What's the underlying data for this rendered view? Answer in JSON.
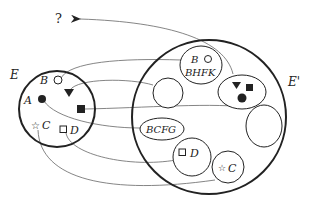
{
  "diagram": {
    "question_mark": "?",
    "source_set": {
      "label": "E",
      "elements": [
        {
          "name": "B",
          "symbol": "open-circle"
        },
        {
          "name": "",
          "symbol": "filled-triangle-down"
        },
        {
          "name": "A",
          "symbol": "filled-circle"
        },
        {
          "name": "",
          "symbol": "filled-square"
        },
        {
          "name": "C",
          "symbol": "open-star"
        },
        {
          "name": "D",
          "symbol": "open-square"
        }
      ]
    },
    "target_set": {
      "label": "E'",
      "subsets": [
        {
          "id": "bhfk",
          "top_label": "B",
          "label": "BHFK",
          "symbol": "open-circle"
        },
        {
          "id": "empty-small",
          "label": ""
        },
        {
          "id": "triangle-square-dot",
          "label": "",
          "symbols": [
            "filled-triangle-down",
            "filled-square",
            "filled-circle"
          ]
        },
        {
          "id": "bcfg",
          "label": "BCFG"
        },
        {
          "id": "empty-large",
          "label": ""
        },
        {
          "id": "d-subset",
          "label": "D",
          "symbol": "open-square"
        },
        {
          "id": "c-subset",
          "label": "C",
          "symbol": "open-star"
        }
      ]
    },
    "colors": {
      "stroke": "#222222",
      "thin_stroke": "#555555",
      "background": "#ffffff"
    }
  }
}
